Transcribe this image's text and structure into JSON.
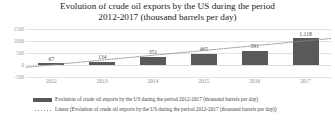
{
  "chart_data": {
    "type": "bar",
    "title": "Evolution of crude oil exports by the US during the period 2012-2017 (thousand barrels per day)",
    "title_line1": "Evolution of crude oil exports by the US during the period",
    "title_line2": "2012-2017 (thousand barrels per day)",
    "xlabel": "",
    "ylabel": "",
    "categories": [
      "2012",
      "2013",
      "2014",
      "2015",
      "2016",
      "2017"
    ],
    "values": [
      67,
      134,
      351,
      465,
      591,
      1118
    ],
    "data_labels": [
      "67",
      "134",
      "351",
      "465",
      "591",
      "1.118"
    ],
    "ylim": [
      -500,
      1500
    ],
    "yticks": [
      1500,
      1000,
      500,
      0,
      -500
    ],
    "ytick_labels": [
      "1500",
      "1000",
      "500",
      "0",
      "-500"
    ],
    "grid": true,
    "legend_position": "bottom",
    "series": [
      {
        "name": "Evolution of crude oil exports by the US during the period 2012-2017 (thousand barrels per day)",
        "type": "bar",
        "color": "#595959",
        "values": [
          67,
          134,
          351,
          465,
          591,
          1118
        ]
      },
      {
        "name": "Linear (Evolution of crude oil exports by the US during the period 2012-2017 (thousand barrels per day))",
        "type": "line",
        "style": "dotted",
        "color": "#8a8a8a",
        "values": [
          5,
          205,
          405,
          605,
          805,
          1005
        ]
      }
    ],
    "legend": [
      {
        "label": "Evolution of crude oil exports by the US during the period 2012-2017 (thousand barrels per day)",
        "marker": "bar",
        "color": "#595959"
      },
      {
        "label": "Linear (Evolution of crude oil exports by the US during the period 2012-2017 (thousand barrels per day))",
        "marker": "dotted-line",
        "color": "#8a8a8a"
      }
    ]
  },
  "colors": {
    "bar": "#595959",
    "trendline": "#8a8a8a",
    "gridline": "#e2e2e2",
    "title_text": "#1a1a1a",
    "tick_text": "#9a9a9a",
    "background": "#ffffff"
  }
}
